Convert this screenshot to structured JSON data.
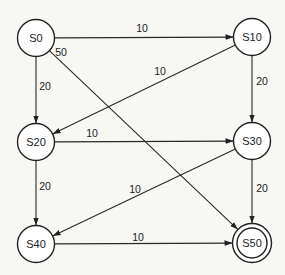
{
  "diagram": {
    "type": "state-machine",
    "colors": {
      "background": "#f7f7f4",
      "stroke": "#222222",
      "node_fill": "#ffffff"
    },
    "nodes": [
      {
        "id": "S0",
        "label": "S0",
        "x": 36,
        "y": 38,
        "accepting": false
      },
      {
        "id": "S10",
        "label": "S10",
        "x": 252,
        "y": 37,
        "accepting": false
      },
      {
        "id": "S20",
        "label": "S20",
        "x": 36,
        "y": 142,
        "accepting": false
      },
      {
        "id": "S30",
        "label": "S30",
        "x": 252,
        "y": 141,
        "accepting": false
      },
      {
        "id": "S40",
        "label": "S40",
        "x": 36,
        "y": 244,
        "accepting": false
      },
      {
        "id": "S50",
        "label": "S50",
        "x": 252,
        "y": 243,
        "accepting": true
      }
    ],
    "edges": [
      {
        "from": "S0",
        "to": "S10",
        "label": "10",
        "lx": 142,
        "ly": 28
      },
      {
        "from": "S0",
        "to": "S20",
        "label": "20",
        "lx": 45,
        "ly": 86
      },
      {
        "from": "S0",
        "to": "S50",
        "label": "50",
        "lx": 61,
        "ly": 52
      },
      {
        "from": "S10",
        "to": "S20",
        "label": "10",
        "lx": 160,
        "ly": 71
      },
      {
        "from": "S10",
        "to": "S30",
        "label": "20",
        "lx": 262,
        "ly": 81
      },
      {
        "from": "S20",
        "to": "S30",
        "label": "10",
        "lx": 92,
        "ly": 133
      },
      {
        "from": "S20",
        "to": "S40",
        "label": "20",
        "lx": 45,
        "ly": 186
      },
      {
        "from": "S30",
        "to": "S40",
        "label": "10",
        "lx": 135,
        "ly": 189
      },
      {
        "from": "S30",
        "to": "S50",
        "label": "20",
        "lx": 262,
        "ly": 188
      },
      {
        "from": "S40",
        "to": "S50",
        "label": "10",
        "lx": 138,
        "ly": 237
      }
    ]
  }
}
